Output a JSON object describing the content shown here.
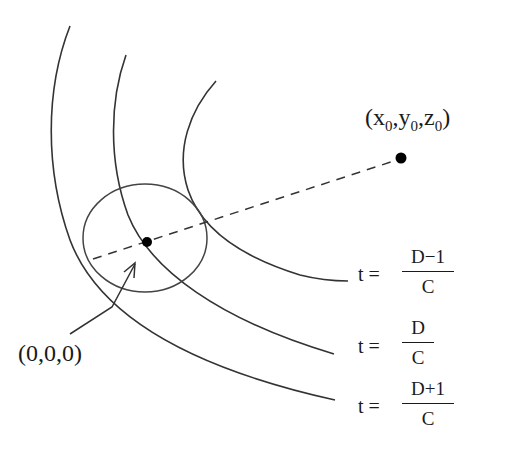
{
  "diagram": {
    "point_far": {
      "x": "x",
      "y": "y",
      "z": "z",
      "subscript": "0"
    },
    "point_origin_label": "(0,0,0)",
    "t_prefix": "t =",
    "wavefronts": [
      {
        "numerator": "D−1",
        "denominator": "C"
      },
      {
        "numerator": "D",
        "denominator": "C"
      },
      {
        "numerator": "D+1",
        "denominator": "C"
      }
    ],
    "colors": {
      "stroke": "#333333",
      "dot": "#000000",
      "background": "#ffffff"
    }
  }
}
